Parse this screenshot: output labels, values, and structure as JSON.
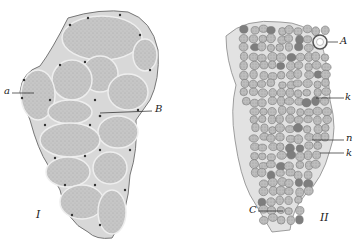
{
  "figure": {
    "panel_I": {
      "numeral": "I",
      "labels": {
        "a": "a",
        "B": "B"
      }
    },
    "panel_II": {
      "numeral": "II",
      "labels": {
        "A": "A",
        "k1": "k",
        "n": "n",
        "k2": "k",
        "C": "C"
      }
    },
    "colors": {
      "tissue_fill": "#c9c9c9",
      "tissue_outline": "#8a8a8a",
      "nuclei": "#333333",
      "background": "#ffffff"
    }
  }
}
